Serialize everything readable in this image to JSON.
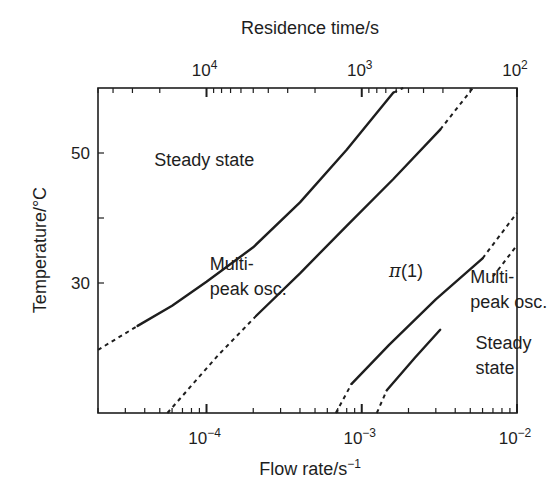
{
  "chart_data": {
    "type": "line",
    "title": "",
    "xlabel": "Flow rate/s⁻¹",
    "ylabel": "Temperature/°C",
    "x2label": "Residence time/s",
    "x_scale": "log",
    "xlim": [
      2e-05,
      0.01
    ],
    "ylim": [
      10,
      60
    ],
    "x_ticks": [
      {
        "value": 0.0001,
        "label": "10",
        "exp": "−4"
      },
      {
        "value": 0.001,
        "label": "10",
        "exp": "−3"
      },
      {
        "value": 0.01,
        "label": "10",
        "exp": "−2"
      }
    ],
    "x2_ticks": [
      {
        "value": 10000.0,
        "label": "10",
        "exp": "4"
      },
      {
        "value": 1000.0,
        "label": "10",
        "exp": "3"
      },
      {
        "value": 100.0,
        "label": "10",
        "exp": "2"
      }
    ],
    "y_ticks": [
      {
        "value": 50,
        "label": "50"
      },
      {
        "value": 40,
        "label": ""
      },
      {
        "value": 30,
        "label": "30"
      }
    ],
    "grid": false,
    "legend": null,
    "series": [
      {
        "name": "Boundary: steady state / multi-peak osc. (upper-left)",
        "solid": [
          [
            3.6e-05,
            23.4
          ],
          [
            6e-05,
            26.5
          ],
          [
            0.0001,
            30.2
          ],
          [
            0.0002,
            35.5
          ],
          [
            0.0004,
            42.4
          ],
          [
            0.0008,
            50.5
          ],
          [
            0.0016,
            59.3
          ]
        ],
        "dashed": [
          [
            2e-05,
            19.7
          ],
          [
            3.6e-05,
            23.4
          ]
        ],
        "dashed_end": [
          [
            0.0016,
            59.3
          ],
          [
            0.00185,
            60
          ]
        ]
      },
      {
        "name": "Boundary: multi-peak osc. / π(1)",
        "solid": [
          [
            0.00021,
            25.0
          ],
          [
            0.0004,
            31.5
          ],
          [
            0.0008,
            38.8
          ],
          [
            0.0016,
            46.0
          ],
          [
            0.0032,
            53.6
          ]
        ],
        "dashed": [
          [
            5.6e-05,
            10.0
          ],
          [
            0.00012,
            19.0
          ],
          [
            0.00021,
            25.0
          ]
        ],
        "dashed_end": [
          [
            0.0032,
            53.6
          ],
          [
            0.0052,
            60
          ]
        ]
      },
      {
        "name": "Boundary: π(1) / multi-peak osc. (lower-right)",
        "solid": [
          [
            0.00086,
            14.5
          ],
          [
            0.0015,
            20.5
          ],
          [
            0.003,
            27.5
          ],
          [
            0.006,
            33.8
          ]
        ],
        "dashed": [
          [
            0.00068,
            10.0
          ],
          [
            0.00086,
            14.5
          ]
        ],
        "dashed_end": [
          [
            0.006,
            33.8
          ],
          [
            0.01,
            40.8
          ]
        ]
      },
      {
        "name": "Boundary: multi-peak osc. / steady state (lower-right)",
        "solid": [
          [
            0.00145,
            13.5
          ],
          [
            0.0022,
            18.5
          ],
          [
            0.0032,
            22.8
          ]
        ],
        "dashed": [
          [
            0.00125,
            10.0
          ],
          [
            0.00145,
            13.5
          ]
        ],
        "dashed_end": [
          [
            0.007,
            31.0
          ],
          [
            0.01,
            35.8
          ]
        ]
      }
    ],
    "annotations": [
      {
        "text": "Steady state",
        "x": 4.6e-05,
        "y": 48.0
      },
      {
        "text": "Multi-",
        "x": 0.000105,
        "y": 32.0
      },
      {
        "text": "peak osc.",
        "x": 0.000105,
        "y": 28.2
      },
      {
        "text": "π(1)",
        "x": 0.0015,
        "y": 31.0
      },
      {
        "text": "Multi-",
        "x": 0.005,
        "y": 30.0
      },
      {
        "text": "peak osc.",
        "x": 0.005,
        "y": 26.2
      },
      {
        "text": "Steady",
        "x": 0.0054,
        "y": 19.8
      },
      {
        "text": "state",
        "x": 0.0054,
        "y": 16.0
      }
    ]
  },
  "layout": {
    "plot": {
      "left": 98,
      "top": 88,
      "right": 517,
      "bottom": 413
    },
    "line_color": "#1e1e1e",
    "background": "#ffffff"
  }
}
